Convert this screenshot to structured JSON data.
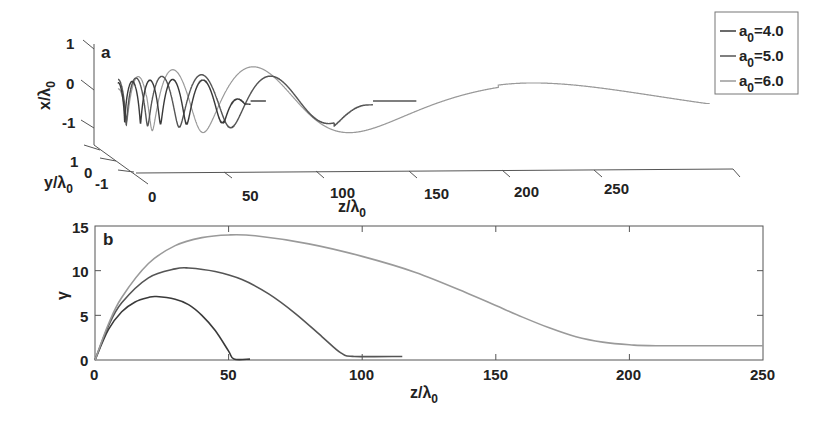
{
  "figure": {
    "panel_a_label": "a",
    "panel_b_label": "b"
  },
  "legend": {
    "items": [
      {
        "label_prefix": "a",
        "label_sub": "0",
        "label_suffix": "=4.0",
        "color": "#3a3a3a"
      },
      {
        "label_prefix": "a",
        "label_sub": "0",
        "label_suffix": "=5.0",
        "color": "#555555"
      },
      {
        "label_prefix": "a",
        "label_sub": "0",
        "label_suffix": "=6.0",
        "color": "#9a9a9a"
      }
    ]
  },
  "panel_a": {
    "xlabel_main": "z/λ",
    "xlabel_sub": "0",
    "ylabel_main": "y/λ",
    "ylabel_sub": "0",
    "zlabel_main": "x/λ",
    "zlabel_sub": "0",
    "z_ticks": [
      "0",
      "50",
      "100",
      "150",
      "200",
      "250"
    ],
    "x_ticks": [
      "1",
      "0",
      "-1"
    ],
    "y_ticks": [
      "1",
      "0",
      "-1"
    ]
  },
  "panel_b": {
    "xlabel_main": "z/λ",
    "xlabel_sub": "0",
    "ylabel": "γ",
    "x_ticks": [
      "0",
      "50",
      "100",
      "150",
      "200",
      "250"
    ],
    "y_ticks": [
      "0",
      "5",
      "10",
      "15"
    ]
  },
  "chart_data": [
    {
      "type": "line",
      "panel": "a",
      "title": "",
      "description": "3D electron trajectories (helical) vs propagation distance",
      "xlabel": "z/λ0",
      "ylabel": "y/λ0",
      "zlabel": "x/λ0",
      "xlim": [
        0,
        250
      ],
      "ylim": [
        -1,
        1
      ],
      "zlim": [
        -1,
        1
      ],
      "series": [
        {
          "name": "a0=4.0",
          "z_extent": [
            0,
            58
          ],
          "note": "tight helix, ends ~z=55"
        },
        {
          "name": "a0=5.0",
          "z_extent": [
            0,
            115
          ],
          "note": "helix, ends ~z=100-115"
        },
        {
          "name": "a0=6.0",
          "z_extent": [
            0,
            240
          ],
          "note": "widening loops, decays near z=200-240"
        }
      ],
      "legend_position": "upper right"
    },
    {
      "type": "line",
      "panel": "b",
      "title": "",
      "xlabel": "z/λ0",
      "ylabel": "γ",
      "xlim": [
        0,
        250
      ],
      "ylim": [
        0,
        15
      ],
      "x": [
        0,
        5,
        10,
        20,
        30,
        40,
        50,
        60,
        70,
        80,
        90,
        100,
        110,
        120,
        130,
        140,
        150,
        160,
        170,
        180,
        190,
        200,
        210,
        220,
        230,
        240,
        250
      ],
      "series": [
        {
          "name": "a0=4.0",
          "points": [
            [
              0,
              0
            ],
            [
              5,
              3.4
            ],
            [
              10,
              5.4
            ],
            [
              15,
              6.5
            ],
            [
              20,
              7.0
            ],
            [
              23,
              7.1
            ],
            [
              30,
              6.8
            ],
            [
              35,
              6.2
            ],
            [
              40,
              5.0
            ],
            [
              45,
              3.3
            ],
            [
              50,
              1.0
            ],
            [
              52,
              0.1
            ],
            [
              58,
              0.1
            ]
          ]
        },
        {
          "name": "a0=5.0",
          "points": [
            [
              0,
              0
            ],
            [
              5,
              3.8
            ],
            [
              10,
              6.4
            ],
            [
              20,
              9.2
            ],
            [
              30,
              10.2
            ],
            [
              35,
              10.3
            ],
            [
              45,
              9.9
            ],
            [
              55,
              9.0
            ],
            [
              65,
              7.4
            ],
            [
              75,
              5.2
            ],
            [
              85,
              2.6
            ],
            [
              92,
              0.8
            ],
            [
              97,
              0.4
            ],
            [
              115,
              0.4
            ]
          ]
        },
        {
          "name": "a0=6.0",
          "points": [
            [
              0,
              0
            ],
            [
              5,
              4.0
            ],
            [
              10,
              7.0
            ],
            [
              20,
              10.8
            ],
            [
              30,
              12.8
            ],
            [
              40,
              13.7
            ],
            [
              50,
              14.0
            ],
            [
              60,
              13.9
            ],
            [
              80,
              13.0
            ],
            [
              100,
              11.6
            ],
            [
              120,
              9.8
            ],
            [
              140,
              7.4
            ],
            [
              150,
              6.1
            ],
            [
              160,
              4.8
            ],
            [
              170,
              3.6
            ],
            [
              180,
              2.6
            ],
            [
              190,
              2.0
            ],
            [
              200,
              1.7
            ],
            [
              210,
              1.6
            ],
            [
              250,
              1.6
            ]
          ]
        }
      ],
      "grid": false
    }
  ]
}
